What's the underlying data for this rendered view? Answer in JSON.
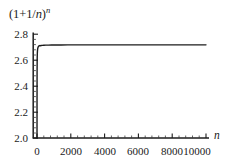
{
  "chart_data": {
    "type": "line",
    "title": "",
    "ylabel": "(1+1/n)^n",
    "ylabel_parts": {
      "prefix": "(1+1/",
      "base_var": "n",
      "middle": ")",
      "exponent": "n"
    },
    "xlabel": "n",
    "xlim": [
      0,
      10400
    ],
    "ylim": [
      2.0,
      2.84
    ],
    "grid": false,
    "legend": null,
    "xticks": [
      0,
      2000,
      4000,
      6000,
      8000,
      10000
    ],
    "xtick_labels": [
      "0",
      "2000",
      "4000",
      "6000",
      "8000",
      "10000"
    ],
    "yticks": [
      2.0,
      2.2,
      2.4,
      2.6,
      2.8
    ],
    "ytick_labels": [
      "2.0",
      "2.2",
      "2.4",
      "2.6",
      "2.8"
    ],
    "x_minor_ticks_per_interval": 4,
    "y_minor_ticks_per_interval": 4,
    "series": [
      {
        "name": "(1+1/n)^n",
        "color": "#1c1c1c",
        "linewidth": 1.4,
        "x": [
          1,
          2,
          3,
          4,
          5,
          6,
          8,
          10,
          13,
          16,
          20,
          26,
          33,
          42,
          54,
          70,
          90,
          115,
          150,
          190,
          245,
          315,
          405,
          520,
          670,
          860,
          1100,
          1420,
          1820,
          2340,
          3000,
          3860,
          4960,
          6370,
          8190,
          10000
        ],
        "y": [
          2.0,
          2.25,
          2.37037,
          2.44141,
          2.48832,
          2.52163,
          2.56578,
          2.59374,
          2.62052,
          2.63693,
          2.6533,
          2.66965,
          2.68017,
          2.68928,
          2.69639,
          2.70193,
          2.70571,
          2.70999,
          2.71264,
          2.71113,
          2.71274,
          2.71398,
          2.71493,
          2.71567,
          2.71625,
          2.7167,
          2.71705,
          2.71733,
          2.71754,
          2.7177,
          2.71783,
          2.71793,
          2.71801,
          2.71807,
          2.71811,
          2.71814
        ]
      }
    ],
    "converges_to": 2.71828,
    "axis_color": "#1c1c1c",
    "background": "#ffffff",
    "spines": [
      "left",
      "bottom"
    ]
  },
  "axes": {
    "y": {
      "tick_labels": [
        "2.8",
        "2.6",
        "2.4",
        "2.2",
        "2.0"
      ]
    },
    "x": {
      "tick_labels": [
        "0",
        "2000",
        "4000",
        "6000",
        "8000",
        "10000"
      ],
      "name": "n"
    }
  }
}
